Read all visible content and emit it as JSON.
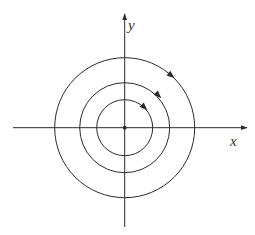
{
  "diagram": {
    "type": "phase-portrait-center",
    "axes": {
      "x_label": "x",
      "y_label": "y"
    },
    "origin": {
      "cx": 124.7,
      "cy": 127.7
    },
    "orbits": [
      {
        "name": "inner",
        "radius": 28,
        "direction": "clockwise"
      },
      {
        "name": "middle",
        "radius": 45,
        "direction": "clockwise"
      },
      {
        "name": "outer",
        "radius": 70,
        "direction": "clockwise"
      }
    ],
    "equilibrium_point": "center",
    "colors": {
      "stroke": "#2b2b2b",
      "background": "#ffffff"
    }
  }
}
